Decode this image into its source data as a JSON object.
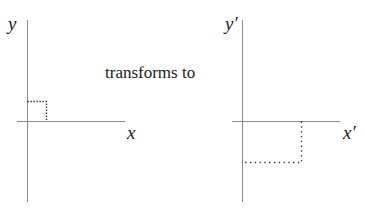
{
  "diagram": {
    "caption": "transforms to",
    "left_panel": {
      "x_label": "x",
      "y_label": "y",
      "shape": "unit square in first quadrant (dotted)"
    },
    "right_panel": {
      "x_label": "x′",
      "y_label": "y′",
      "shape": "rectangle in fourth quadrant (dotted), stretched horizontally and flipped vertically"
    },
    "colors": {
      "axis": "#8a8a8a",
      "dotted": "#333333",
      "text": "#1a1a1a"
    }
  }
}
